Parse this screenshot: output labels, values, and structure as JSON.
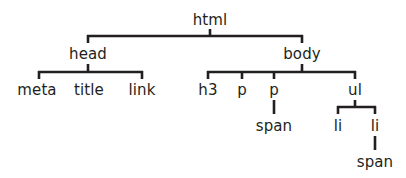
{
  "diagram": {
    "colors": {
      "line": "#231f20",
      "text": "#231f20",
      "background": "#ffffff"
    },
    "nodes": [
      {
        "id": "html",
        "label": "html",
        "x": 210,
        "y": 13,
        "parent": null
      },
      {
        "id": "head",
        "label": "head",
        "x": 88,
        "y": 47,
        "parent": "html"
      },
      {
        "id": "body",
        "label": "body",
        "x": 302,
        "y": 47,
        "parent": "html"
      },
      {
        "id": "meta",
        "label": "meta",
        "x": 37,
        "y": 83,
        "parent": "head"
      },
      {
        "id": "title",
        "label": "title",
        "x": 89,
        "y": 83,
        "parent": "head"
      },
      {
        "id": "link",
        "label": "link",
        "x": 142,
        "y": 83,
        "parent": "head"
      },
      {
        "id": "h3",
        "label": "h3",
        "x": 208,
        "y": 83,
        "parent": "body"
      },
      {
        "id": "p1",
        "label": "p",
        "x": 242,
        "y": 83,
        "parent": "body"
      },
      {
        "id": "p2",
        "label": "p",
        "x": 274,
        "y": 83,
        "parent": "body"
      },
      {
        "id": "ul",
        "label": "ul",
        "x": 355,
        "y": 83,
        "parent": "body"
      },
      {
        "id": "span1",
        "label": "span",
        "x": 274,
        "y": 119,
        "parent": "p2"
      },
      {
        "id": "li1",
        "label": "li",
        "x": 338,
        "y": 119,
        "parent": "ul"
      },
      {
        "id": "li2",
        "label": "li",
        "x": 375,
        "y": 119,
        "parent": "ul"
      },
      {
        "id": "span2",
        "label": "span",
        "x": 375,
        "y": 155,
        "parent": "li2"
      }
    ],
    "edges": [
      {
        "from": "html",
        "to": [
          "head",
          "body"
        ]
      },
      {
        "from": "head",
        "to": [
          "meta",
          "title",
          "link"
        ]
      },
      {
        "from": "body",
        "to": [
          "h3",
          "p1",
          "p2",
          "ul"
        ]
      },
      {
        "from": "p2",
        "to": [
          "span1"
        ]
      },
      {
        "from": "ul",
        "to": [
          "li1",
          "li2"
        ]
      },
      {
        "from": "li2",
        "to": [
          "span2"
        ]
      }
    ]
  }
}
